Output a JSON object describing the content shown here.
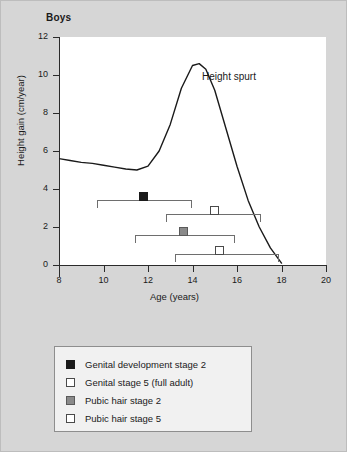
{
  "chart": {
    "title": "Boys",
    "annotation": "Height spurt",
    "xlabel": "Age (years)",
    "ylabel": "Height gain (cm/year)"
  },
  "axes": {
    "x_ticks": [
      "8",
      "10",
      "12",
      "14",
      "16",
      "18",
      "20"
    ],
    "y_ticks": [
      "12",
      "10",
      "8",
      "6",
      "4",
      "2",
      "0"
    ]
  },
  "legend": {
    "items": [
      {
        "label": "Genital development stage 2",
        "swatch": "filled-black-square-icon"
      },
      {
        "label": "Genital stage 5 (full adult)",
        "swatch": "open-square-icon"
      },
      {
        "label": "Pubic hair stage 2",
        "swatch": "filled-gray-square-icon"
      },
      {
        "label": "Pubic hair stage 5",
        "swatch": "open-square-icon"
      }
    ]
  },
  "colors": {
    "background": "#d6d6d6",
    "plot_background": "#ffffff",
    "axis": "#2b2b2b",
    "curve": "#1a1a1a",
    "range_bar": "#6e6e6e",
    "marker_black": "#1a1a1a",
    "marker_gray": "#8a8a8a",
    "marker_open": "#ffffff",
    "legend_background": "#f1f1f1"
  },
  "chart_data": {
    "type": "line",
    "title": "Boys",
    "xlabel": "Age (years)",
    "ylabel": "Height gain (cm/year)",
    "xlim": [
      8,
      20
    ],
    "ylim": [
      0,
      12
    ],
    "grid": false,
    "legend_position": "below-plot",
    "annotations": [
      {
        "text": "Height spurt",
        "x": 16.0,
        "y": 9.3
      }
    ],
    "series": [
      {
        "name": "Height velocity",
        "type": "line",
        "x": [
          8.0,
          8.5,
          9.0,
          9.5,
          10.0,
          10.5,
          11.0,
          11.5,
          12.0,
          12.5,
          13.0,
          13.5,
          14.0,
          14.3,
          14.6,
          15.0,
          15.5,
          16.0,
          16.5,
          17.0,
          17.5,
          18.0
        ],
        "y": [
          5.6,
          5.5,
          5.4,
          5.35,
          5.25,
          5.15,
          5.05,
          5.0,
          5.2,
          6.0,
          7.4,
          9.3,
          10.5,
          10.6,
          10.3,
          9.2,
          7.2,
          5.2,
          3.4,
          2.0,
          0.9,
          0.1
        ]
      }
    ],
    "stage_ranges": [
      {
        "name": "Genital development stage 2",
        "marker": "filled-black",
        "range_start": 9.7,
        "range_end": 14.0,
        "mean": 11.8,
        "y": 3.4
      },
      {
        "name": "Genital stage 5 (full adult)",
        "marker": "open",
        "range_start": 12.8,
        "range_end": 17.1,
        "mean": 15.0,
        "y": 2.7
      },
      {
        "name": "Pubic hair stage 2",
        "marker": "filled-gray",
        "range_start": 11.4,
        "range_end": 15.9,
        "mean": 13.6,
        "y": 1.6
      },
      {
        "name": "Pubic hair stage 5",
        "marker": "open",
        "range_start": 13.2,
        "range_end": 17.9,
        "mean": 15.2,
        "y": 0.6
      }
    ]
  }
}
